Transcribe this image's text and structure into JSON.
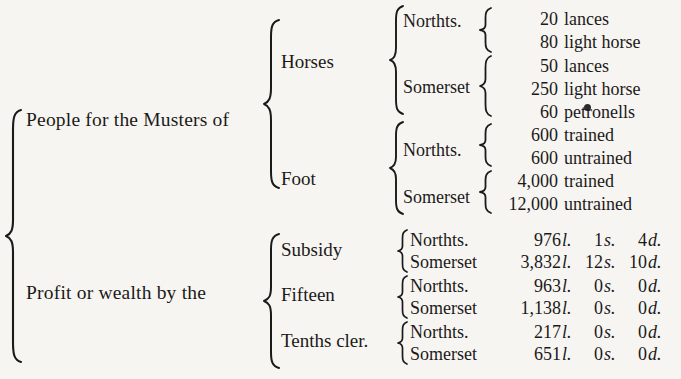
{
  "document": {
    "type": "bracketed-tabulation",
    "ink_color": "#1b1a19",
    "paper_color": "#f7f5f2"
  },
  "root": {
    "branches": [
      {
        "label": "People for the Musters of"
      },
      {
        "label": "Profit or wealth by the"
      }
    ]
  },
  "musters": {
    "categories": [
      {
        "label": "Horses"
      },
      {
        "label": "Foot"
      }
    ],
    "horses": {
      "counties": [
        {
          "name": "Northts."
        },
        {
          "name": "Somerset"
        }
      ],
      "northts_rows": [
        {
          "amount": "20",
          "kind": "lances"
        },
        {
          "amount": "80",
          "kind": "light horse"
        }
      ],
      "somerset_rows": [
        {
          "amount": "50",
          "kind": "lances"
        },
        {
          "amount": "250",
          "kind": "light horse"
        },
        {
          "amount": "60",
          "kind": "petronells"
        }
      ]
    },
    "foot": {
      "counties": [
        {
          "name": "Northts."
        },
        {
          "name": "Somerset"
        }
      ],
      "northts_rows": [
        {
          "amount": "600",
          "kind": "trained"
        },
        {
          "amount": "600",
          "kind": "untrained"
        }
      ],
      "somerset_rows": [
        {
          "amount": "4,000",
          "kind": "trained"
        },
        {
          "amount": "12,000",
          "kind": "untrained"
        }
      ]
    }
  },
  "profit": {
    "categories": [
      {
        "label": "Subsidy"
      },
      {
        "label": "Fifteen"
      },
      {
        "label": "Tenths cler."
      }
    ],
    "currency_marks": {
      "pounds": "l.",
      "shillings": "s.",
      "pence": "d."
    },
    "groups": [
      {
        "category": "Subsidy",
        "rows": [
          {
            "county": "Northts.",
            "pounds": "976",
            "pounds_mark": "l.",
            "shillings": "1",
            "shillings_mark": "s.",
            "pence": "4",
            "pence_mark": "d."
          },
          {
            "county": "Somerset",
            "pounds": "3,832",
            "pounds_mark": "l.",
            "shillings": "12",
            "shillings_mark": "s.",
            "pence": "10",
            "pence_mark": "d."
          }
        ]
      },
      {
        "category": "Fifteen",
        "rows": [
          {
            "county": "Northts.",
            "pounds": "963",
            "pounds_mark": "l.",
            "shillings": "0",
            "shillings_mark": "s.",
            "pence": "0",
            "pence_mark": "d."
          },
          {
            "county": "Somerset",
            "pounds": "1,138",
            "pounds_mark": "l.",
            "shillings": "0",
            "shillings_mark": "s.",
            "pence": "0",
            "pence_mark": "d."
          }
        ]
      },
      {
        "category": "Tenths cler.",
        "rows": [
          {
            "county": "Northts.",
            "pounds": "217",
            "pounds_mark": "l.",
            "shillings": "0",
            "shillings_mark": "s.",
            "pence": "0",
            "pence_mark": "d."
          },
          {
            "county": "Somerset",
            "pounds": "651",
            "pounds_mark": "l.",
            "shillings": "0",
            "shillings_mark": "s.",
            "pence": "0",
            "pence_mark": "d."
          }
        ]
      }
    ]
  }
}
